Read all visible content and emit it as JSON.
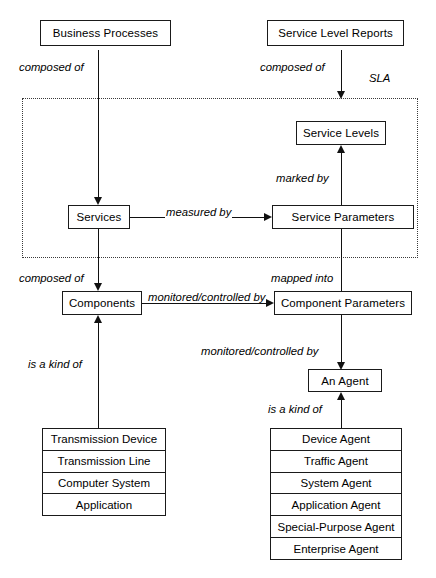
{
  "diagram": {
    "region": {
      "label": "SLA"
    },
    "nodes": {
      "business_processes": "Business Processes",
      "service_level_reports": "Service Level Reports",
      "service_levels": "Service Levels",
      "services": "Services",
      "service_parameters": "Service Parameters",
      "components": "Components",
      "component_parameters": "Component Parameters",
      "an_agent": "An Agent"
    },
    "component_kinds": [
      "Transmission Device",
      "Transmission Line",
      "Computer System",
      "Application"
    ],
    "agent_kinds": [
      "Device Agent",
      "Traffic Agent",
      "System Agent",
      "Application Agent",
      "Special-Purpose Agent",
      "Enterprise Agent"
    ],
    "edges": {
      "bp_to_services": "composed of",
      "slr_to_sla": "composed of",
      "services_to_parameters": "measured by",
      "parameters_to_levels": "marked by",
      "services_to_components": "composed of",
      "service_params_to_component_params": "mapped into",
      "components_to_component_params": "monitored/controlled by",
      "component_params_to_agent": "monitored/controlled by",
      "component_kinds_is_a": "is a kind of",
      "agent_kinds_is_a": "is a kind of"
    },
    "colors": {
      "ink": "#111111",
      "box_border": "#1a1a1a",
      "region_border": "#3a3a3a",
      "background": "#ffffff"
    }
  }
}
